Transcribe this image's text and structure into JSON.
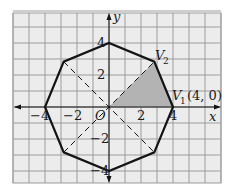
{
  "figure": {
    "type": "regular-octagon-on-coordinate-grid",
    "grid": {
      "xmin": -6,
      "xmax": 7,
      "ymin": -4.75,
      "ymax": 5.875,
      "step": 1
    },
    "axes": {
      "x_label": "x",
      "y_label": "y",
      "origin_label": "O"
    },
    "x_ticks": [
      {
        "value": -4,
        "label": "−4"
      },
      {
        "value": -2,
        "label": "−2"
      },
      {
        "value": 2,
        "label": "2"
      },
      {
        "value": 4,
        "label": "4"
      }
    ],
    "y_ticks": [
      {
        "value": 4,
        "label": "4"
      },
      {
        "value": 2,
        "label": "2"
      },
      {
        "value": -2,
        "label": "−2"
      },
      {
        "value": -4,
        "label": "−4"
      }
    ],
    "octagon": {
      "radius": 4,
      "vertices": [
        [
          4,
          0
        ],
        [
          2.83,
          2.83
        ],
        [
          0,
          4
        ],
        [
          -2.83,
          2.83
        ],
        [
          -4,
          0
        ],
        [
          -2.83,
          -2.83
        ],
        [
          0,
          -4
        ],
        [
          2.83,
          -2.83
        ]
      ]
    },
    "dashed_diagonals": [
      [
        [
          -2.83,
          2.83
        ],
        [
          2.83,
          -2.83
        ]
      ],
      [
        [
          -2.83,
          -2.83
        ],
        [
          2.83,
          2.83
        ]
      ]
    ],
    "shaded_triangle": [
      [
        0,
        0
      ],
      [
        4,
        0
      ],
      [
        2.83,
        2.83
      ]
    ],
    "labels": {
      "v1": "V",
      "v1_sub": "1",
      "v1_coords": "(4, 0)",
      "v2": "V",
      "v2_sub": "2"
    },
    "colors": {
      "background": "#ececec",
      "grid": "#9d9d9d",
      "shade": "#b3b3b3",
      "stroke": "#141414"
    }
  }
}
